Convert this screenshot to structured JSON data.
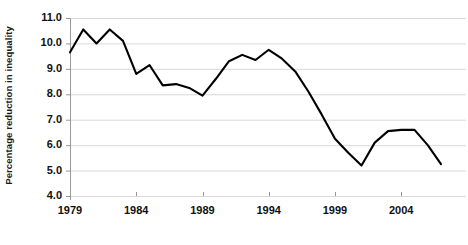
{
  "chart_data": {
    "type": "line",
    "title": "",
    "xlabel": "",
    "ylabel": "Percentage reduction in inequality",
    "xlim": [
      1979,
      2007
    ],
    "ylim": [
      4.0,
      11.0
    ],
    "grid": true,
    "legend": "none",
    "x": [
      1979,
      1980,
      1981,
      1982,
      1983,
      1984,
      1985,
      1986,
      1987,
      1988,
      1989,
      1990,
      1991,
      1992,
      1993,
      1994,
      1995,
      1996,
      1997,
      1998,
      1999,
      2000,
      2001,
      2002,
      2003,
      2004,
      2005,
      2006,
      2007
    ],
    "values": [
      9.65,
      10.55,
      10.0,
      10.55,
      10.1,
      8.8,
      9.15,
      8.35,
      8.4,
      8.25,
      7.95,
      8.6,
      9.3,
      9.55,
      9.35,
      9.75,
      9.4,
      8.9,
      8.1,
      7.2,
      6.25,
      5.7,
      5.2,
      6.1,
      6.55,
      6.6,
      6.6,
      6.0,
      5.25
    ],
    "x_tick_labels": [
      "1979",
      "1984",
      "1989",
      "1994",
      "1999",
      "2004"
    ],
    "x_tick_values": [
      1979,
      1984,
      1989,
      1994,
      1999,
      2004
    ],
    "y_tick_labels": [
      "11.0",
      "10.0",
      "9.0",
      "8.0",
      "7.0",
      "6.0",
      "5.0",
      "4.0"
    ],
    "y_tick_values": [
      11.0,
      10.0,
      9.0,
      8.0,
      7.0,
      6.0,
      5.0,
      4.0
    ],
    "line_color": "#000000",
    "grid_color": "#d9d9d9",
    "axis_color": "#999999",
    "background_color": "#ffffff"
  }
}
